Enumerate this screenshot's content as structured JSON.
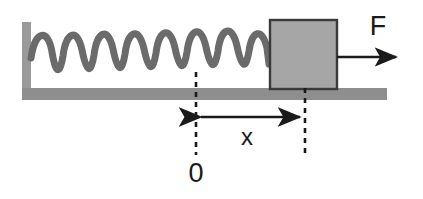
{
  "diagram": {
    "type": "physics-free-body-diagram",
    "canvas": {
      "width": 423,
      "height": 199,
      "background_color": "#ffffff"
    },
    "labels": {
      "force": "F",
      "displacement": "x",
      "origin": "0"
    },
    "colors": {
      "wall_fill": "#9a9a9a",
      "floor_fill": "#8e8e8e",
      "block_fill": "#a6a6a6",
      "block_border": "#3a3a3a",
      "spring_stroke": "#6b6b6b",
      "arrow_stroke": "#1a1a1a",
      "dashed_stroke": "#1a1a1a",
      "text_color": "#1a1a1a"
    },
    "elements": {
      "wall": {
        "name": "wall",
        "x": 22,
        "y": 22,
        "width": 9,
        "height": 78
      },
      "floor": {
        "name": "floor",
        "x": 22,
        "y": 88,
        "width": 365,
        "height": 12
      },
      "spring": {
        "name": "spring",
        "start_x": 31,
        "end_x": 270,
        "center_y": 50,
        "amplitude": 23,
        "coils": 8,
        "stroke_width": 7
      },
      "block": {
        "name": "block",
        "x": 270,
        "y": 20,
        "width": 67,
        "height": 69
      },
      "force_arrow": {
        "name": "force-arrow",
        "start_x": 337,
        "end_x": 400,
        "y": 57,
        "direction": "right"
      },
      "force_label_pos": {
        "x": 378,
        "y": 33
      },
      "dashed_line_origin": {
        "name": "dashed-line-origin",
        "x": 196,
        "y_top": 72,
        "y_bottom": 155
      },
      "dashed_line_displaced": {
        "name": "dashed-line-displaced",
        "x": 305,
        "y_top": 88,
        "y_bottom": 155
      },
      "displacement_arrow": {
        "name": "displacement-arrow",
        "left_x": 196,
        "right_x": 305,
        "y": 117,
        "direction": "both"
      },
      "displacement_label_pos": {
        "x": 247,
        "y": 144
      },
      "origin_label_pos": {
        "x": 196,
        "y": 180
      }
    }
  }
}
